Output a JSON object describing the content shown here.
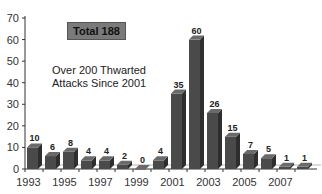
{
  "chart_data": {
    "type": "bar",
    "title": "",
    "xlabel": "",
    "ylabel": "",
    "ylim": [
      0,
      70
    ],
    "yticks": [
      0,
      10,
      20,
      30,
      40,
      50,
      60,
      70
    ],
    "grid": false,
    "legend": null,
    "style": "3d-bar",
    "bar_color": "#4a4a4a",
    "categories": [
      "1993",
      "1994",
      "1995",
      "1996",
      "1997",
      "1998",
      "1999",
      "2000",
      "2001",
      "2002",
      "2003",
      "2004",
      "2005",
      "2006",
      "2007",
      "2008"
    ],
    "xtick_labels": [
      "1993",
      "1995",
      "1997",
      "1999",
      "2001",
      "2003",
      "2005",
      "2007"
    ],
    "values": [
      10,
      6,
      8,
      4,
      4,
      2,
      0,
      4,
      35,
      60,
      26,
      15,
      7,
      5,
      1,
      1
    ],
    "data_labels": [
      "10",
      "6",
      "8",
      "4",
      "4",
      "2",
      "0",
      "4",
      "35",
      "60",
      "26",
      "15",
      "7",
      "5",
      "1",
      "1"
    ],
    "annotations": [
      {
        "text": "Total 188",
        "type": "box"
      },
      {
        "text": "Over 200 Thwarted\nAttacks Since 2001",
        "type": "text"
      }
    ]
  },
  "annotations": {
    "total_label": "Total 188",
    "note": "Over 200 Thwarted\nAttacks Since 2001"
  }
}
